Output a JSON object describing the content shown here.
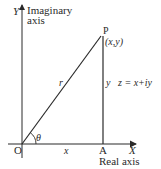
{
  "diagram": {
    "type": "argand-diagram",
    "labels": {
      "y_axis_letter": "Y",
      "y_axis_name_line1": "Imaginary",
      "y_axis_name_line2": "axis",
      "x_axis_letter": "X",
      "x_axis_name": "Real axis",
      "origin": "O",
      "foot_point": "A",
      "point": "P",
      "point_coords": "(x,y)",
      "hypotenuse": "r",
      "angle": "θ",
      "horizontal_leg": "x",
      "vertical_leg": "y",
      "equation": "z = x+iy"
    },
    "colors": {
      "line": "#2a2a2a",
      "background": "#ffffff"
    }
  }
}
